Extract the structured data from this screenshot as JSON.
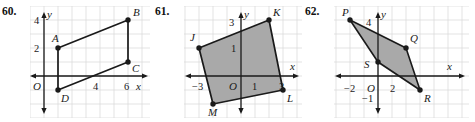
{
  "page": {
    "background": "#ffffff",
    "ink": "#1a1a1a",
    "grid_color": "#d8d8d8",
    "fill_gray": "#a9a9a9",
    "width": 475,
    "height": 122
  },
  "problems": [
    {
      "number": "60.",
      "shaded": false,
      "axis_labels": {
        "x": "x",
        "y": "y",
        "origin": "O"
      },
      "tick_labels": [
        {
          "text": "4",
          "axis": "y",
          "value": 4
        },
        {
          "text": "2",
          "axis": "y",
          "value": 2
        },
        {
          "text": "4",
          "axis": "x",
          "value": 4
        },
        {
          "text": "6",
          "axis": "x",
          "value": 6
        }
      ],
      "vertices": [
        {
          "label": "A",
          "x": 1,
          "y": 2
        },
        {
          "label": "B",
          "x": 6,
          "y": 4
        },
        {
          "label": "C",
          "x": 6,
          "y": 1
        },
        {
          "label": "D",
          "x": 1,
          "y": -1
        }
      ],
      "edges": [
        "A-B",
        "B-C",
        "C-D",
        "D-A"
      ]
    },
    {
      "number": "61.",
      "shaded": true,
      "axis_labels": {
        "x": "x",
        "y": "y",
        "origin": "O"
      },
      "tick_labels": [
        {
          "text": "3",
          "axis": "y",
          "value": 3
        },
        {
          "text": "1",
          "axis": "y",
          "value": 1
        },
        {
          "text": "−3",
          "axis": "x",
          "value": -3
        },
        {
          "text": "1",
          "axis": "x",
          "value": 1
        },
        {
          "text": "3",
          "axis": "x",
          "value": 3
        }
      ],
      "vertices": [
        {
          "label": "J",
          "x": -3,
          "y": 2
        },
        {
          "label": "K",
          "x": 2,
          "y": 3
        },
        {
          "label": "L",
          "x": 3,
          "y": -1
        },
        {
          "label": "M",
          "x": -2,
          "y": -2
        }
      ],
      "edges": [
        "J-K",
        "K-L",
        "L-M",
        "M-J"
      ]
    },
    {
      "number": "62.",
      "shaded": true,
      "axis_labels": {
        "x": "x",
        "y": "y",
        "origin": "O"
      },
      "tick_labels": [
        {
          "text": "4",
          "axis": "y",
          "value": 4
        },
        {
          "text": "−2",
          "axis": "x",
          "value": -2
        },
        {
          "text": "−1",
          "axis": "y",
          "value": -1
        },
        {
          "text": "2",
          "axis": "x",
          "value": 2
        }
      ],
      "vertices": [
        {
          "label": "P",
          "x": -2,
          "y": 4
        },
        {
          "label": "Q",
          "x": 2,
          "y": 2
        },
        {
          "label": "R",
          "x": 3,
          "y": -1
        },
        {
          "label": "S",
          "x": -0.2,
          "y": 1
        }
      ],
      "edges": [
        "P-Q",
        "Q-R",
        "R-S",
        "S-P"
      ]
    }
  ]
}
